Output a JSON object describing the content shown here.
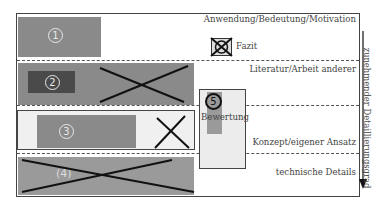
{
  "levels": [
    {
      "label": "Anwendung/Bedeutung/Motivation",
      "number": "1",
      "crossed": false
    },
    {
      "label": "Literatur/Arbeit anderer",
      "number": "2",
      "crossed": true
    },
    {
      "label": "Konzept/eigener Ansatz",
      "number": "3",
      "crossed": "partial"
    },
    {
      "label": "technische Details",
      "number": "4",
      "crossed": true
    }
  ],
  "fazit": {
    "label": "Fazit",
    "crossed": true
  },
  "bewertung": {
    "label": "Bewertung",
    "number": "5"
  },
  "axis": {
    "label": "zunehmender Detaillierungsgrad",
    "direction": "down"
  },
  "colors": {
    "box_dark": "#5e5e5e",
    "box_mid": "#8a8a8a",
    "box_light": "#9a9a9a",
    "panel_light": "#efefef",
    "line": "#222222"
  }
}
